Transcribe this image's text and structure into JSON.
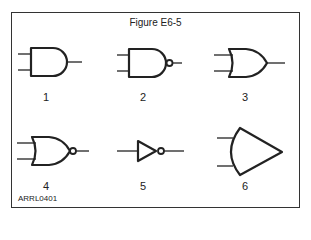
{
  "figure": {
    "title": "Figure E6-5",
    "credit": "ARRL0401",
    "gates": [
      {
        "label": "1",
        "symbol": "and-gate"
      },
      {
        "label": "2",
        "symbol": "nand-gate"
      },
      {
        "label": "3",
        "symbol": "or-gate"
      },
      {
        "label": "4",
        "symbol": "nor-gate"
      },
      {
        "label": "5",
        "symbol": "inverter"
      },
      {
        "label": "6",
        "symbol": "comparator-like-gate"
      }
    ]
  }
}
